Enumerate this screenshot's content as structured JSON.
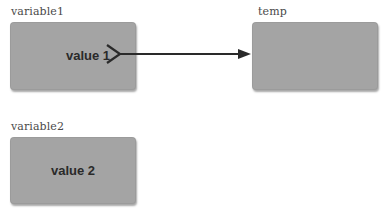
{
  "diagram": {
    "variables": [
      {
        "name": "variable1",
        "value": "value 1"
      },
      {
        "name": "temp",
        "value": ""
      },
      {
        "name": "variable2",
        "value": "value 2"
      }
    ],
    "arrow": {
      "from": "variable1",
      "to": "temp"
    },
    "colors": {
      "box_fill": "#a4a4a4",
      "arrow": "#2a2a2a",
      "label_text": "#4a4a4a"
    }
  }
}
